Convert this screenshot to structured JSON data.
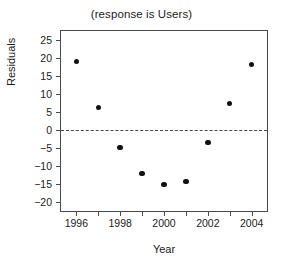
{
  "chart_data": {
    "type": "scatter",
    "title": "(response is Users)",
    "xlabel": "Year",
    "ylabel": "Residuals",
    "x": [
      1996,
      1997,
      1998,
      1999,
      2000,
      2001,
      2002,
      2003,
      2004
    ],
    "values": [
      19.0,
      6.3,
      -4.9,
      -12.0,
      -15.2,
      -14.3,
      -3.4,
      7.3,
      18.2
    ],
    "xlim": [
      1995.3,
      2004.7
    ],
    "ylim": [
      -22.5,
      27.5
    ],
    "xticks": [
      1996,
      1997,
      1998,
      1999,
      2000,
      2001,
      2002,
      2003,
      2004
    ],
    "xtick_labels": [
      "1996",
      "",
      "1998",
      "",
      "2000",
      "",
      "2002",
      "",
      "2004"
    ],
    "yticks": [
      25,
      20,
      15,
      10,
      5,
      0,
      -5,
      -10,
      -15,
      -20
    ],
    "ytick_labels": [
      "25",
      "20",
      "15",
      "10",
      "5",
      "0",
      "−5",
      "−10",
      "−15",
      "−20"
    ],
    "grid": false,
    "legend": false,
    "reference_line": {
      "y": 0,
      "style": "dashed"
    },
    "marker": {
      "shape": "circle",
      "filled": true,
      "color": "#111111"
    },
    "axis_color": "#4a4a4a",
    "background": "#ffffff"
  }
}
